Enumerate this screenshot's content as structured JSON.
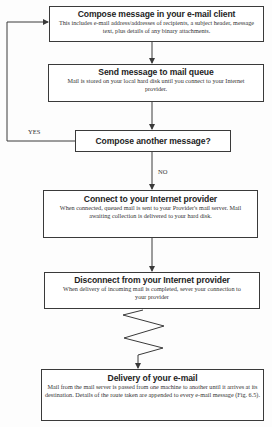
{
  "diagram": {
    "type": "flowchart",
    "steps": [
      {
        "title": "Compose message in your e-mail client",
        "description": "This includes e-mail address/addresses of recipients, a subject header, message text, plus details of any binary attachments."
      },
      {
        "title": "Send message to mail queue",
        "description": "Mail is stored on your local hard disk until you connect to your Internet provider."
      },
      {
        "title": "Compose another message?",
        "description": ""
      },
      {
        "title": "Connect to your Internet provider",
        "description": "When connected, queued mail is sent to your Provider's mail server. Mail awaiting collection is delivered to your hard disk."
      },
      {
        "title": "Disconnect from your Internet provider",
        "description": "When delivery of incoming mail is completed, sever your connection to your provider"
      },
      {
        "title": "Delivery of your e-mail",
        "description": "Mail from the mail server is passed from one machine to another until it arrives at its destination. Details of the route taken are appended to every e-mail message (Fig. 6.5)."
      }
    ],
    "edge_labels": {
      "yes": "YES",
      "no": "NO"
    },
    "colors": {
      "line": "#3a3a3a",
      "text": "#1e1e1e"
    }
  }
}
